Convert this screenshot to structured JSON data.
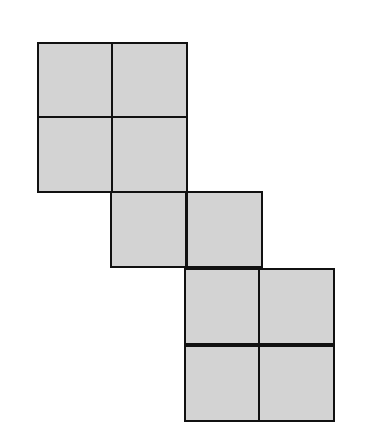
{
  "diagram": {
    "type": "net of squares",
    "fill_color": "#d3d3d3",
    "stroke_color": "#111111",
    "cell_size": 76,
    "cells": [
      {
        "row": 0,
        "col": 0,
        "x": 37,
        "y": 42
      },
      {
        "row": 0,
        "col": 1,
        "x": 111,
        "y": 42
      },
      {
        "row": 1,
        "col": 0,
        "x": 37,
        "y": 116
      },
      {
        "row": 1,
        "col": 1,
        "x": 111,
        "y": 116
      },
      {
        "row": 2,
        "col": 1,
        "x": 110,
        "y": 191
      },
      {
        "row": 2,
        "col": 2,
        "x": 186,
        "y": 191
      },
      {
        "row": 3,
        "col": 2,
        "x": 184,
        "y": 268
      },
      {
        "row": 3,
        "col": 3,
        "x": 258,
        "y": 268
      },
      {
        "row": 4,
        "col": 2,
        "x": 184,
        "y": 345
      },
      {
        "row": 4,
        "col": 3,
        "x": 258,
        "y": 345
      }
    ]
  }
}
